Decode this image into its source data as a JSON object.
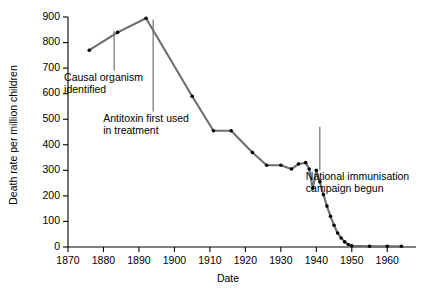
{
  "chart_data": {
    "type": "line",
    "title": "",
    "xlabel": "Date",
    "ylabel": "Death rate per million children",
    "xlim": [
      1870,
      1965
    ],
    "ylim": [
      0,
      900
    ],
    "grid": false,
    "legend": "none",
    "xticks": [
      1870,
      1880,
      1890,
      1900,
      1910,
      1920,
      1930,
      1940,
      1950,
      1960
    ],
    "xtick_labels": [
      "1870",
      "1880",
      "1890",
      "1900",
      "1910",
      "1920",
      "1930",
      "1940",
      "1950",
      "1960"
    ],
    "yticks": [
      0,
      100,
      200,
      300,
      400,
      500,
      600,
      700,
      800,
      900
    ],
    "ytick_labels": [
      "0",
      "100",
      "200",
      "300",
      "400",
      "500",
      "600",
      "700",
      "800",
      "900"
    ],
    "series": [
      {
        "name": "Diphtheria death rate",
        "color": "#6e6e6e",
        "marker_color": "#000000",
        "x": [
          1876,
          1884,
          1892,
          1905,
          1911,
          1916,
          1922,
          1926,
          1930,
          1933,
          1935,
          1937,
          1938,
          1939,
          1940,
          1941,
          1942,
          1943,
          1944,
          1945,
          1946,
          1947,
          1948,
          1949,
          1950,
          1955,
          1960,
          1964
        ],
        "values": [
          770,
          840,
          895,
          590,
          455,
          455,
          370,
          320,
          320,
          305,
          325,
          330,
          305,
          230,
          300,
          255,
          205,
          160,
          120,
          85,
          55,
          35,
          20,
          10,
          5,
          3,
          3,
          3
        ]
      }
    ],
    "annotations": [
      {
        "id": "causal-organism",
        "lines": [
          "Causal organism",
          "identified"
        ],
        "year": 1883,
        "leader_from_year": 1883,
        "leader_top_value": 845,
        "leader_bottom_value": 690
      },
      {
        "id": "antitoxin",
        "lines": [
          "Antitoxin first used",
          "in treatment"
        ],
        "year": 1894,
        "leader_from_year": 1894,
        "leader_top_value": 890,
        "leader_bottom_value": 530
      },
      {
        "id": "national-immunisation",
        "lines": [
          "National immunisation",
          "campaign begun"
        ],
        "year": 1941,
        "leader_from_year": 1941,
        "leader_top_value": 470,
        "leader_bottom_value": 300
      }
    ]
  }
}
